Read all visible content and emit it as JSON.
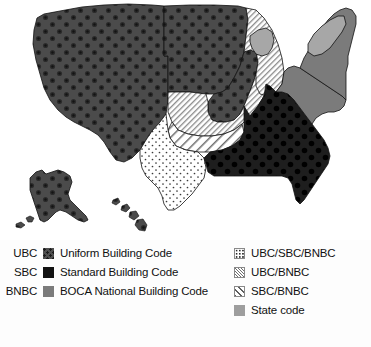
{
  "figure": {
    "kind": "thematic-choropleth-map",
    "region": "United States",
    "title": ""
  },
  "legend": {
    "left_column": [
      {
        "abbr": "UBC",
        "label": "Uniform Building Code",
        "swatch": "dark-gray-textured",
        "color": "#4f4f4f"
      },
      {
        "abbr": "SBC",
        "label": "Standard Building Code",
        "swatch": "black-solid",
        "color": "#121212"
      },
      {
        "abbr": "BNBC",
        "label": "BOCA National Building Code",
        "swatch": "medium-gray-solid",
        "color": "#7b7b7b"
      }
    ],
    "right_column": [
      {
        "abbr": "",
        "label": "UBC/SBC/BNBC",
        "swatch": "white-dotted",
        "color": "#ffffff"
      },
      {
        "abbr": "",
        "label": "UBC/BNBC",
        "swatch": "fine-diagonal-hatch",
        "color": "#ffffff"
      },
      {
        "abbr": "",
        "label": "SBC/BNBC",
        "swatch": "coarse-diagonal-hatch",
        "color": "#ffffff"
      },
      {
        "abbr": "",
        "label": "State code",
        "swatch": "light-gray-solid",
        "color": "#9e9e9e"
      }
    ]
  },
  "map": {
    "categories": {
      "ubc": "Uniform Building Code",
      "sbc": "Standard Building Code",
      "bnbc": "BOCA National Building Code",
      "ubc_sbc_bnbc": "UBC/SBC/BNBC",
      "ubc_bnbc": "UBC/BNBC",
      "sbc_bnbc": "SBC/BNBC",
      "state": "State code"
    },
    "colors": {
      "ubc": "#4f4f4f",
      "sbc": "#121212",
      "bnbc": "#7b7b7b",
      "state": "#9e9e9e",
      "outline": "#111111",
      "background": "#ffffff"
    },
    "areas": [
      {
        "name": "western-states",
        "category": "ubc"
      },
      {
        "name": "plains-states",
        "category": "ubc_bnbc"
      },
      {
        "name": "great-lakes-states",
        "category": "ubc_bnbc"
      },
      {
        "name": "oklahoma-kansas",
        "category": "sbc_bnbc"
      },
      {
        "name": "texas",
        "category": "ubc_sbc_bnbc"
      },
      {
        "name": "southeast-states",
        "category": "sbc"
      },
      {
        "name": "northeast-states",
        "category": "bnbc"
      },
      {
        "name": "mid-atlantic-states",
        "category": "bnbc"
      },
      {
        "name": "wisconsin-michigan",
        "category": "state"
      },
      {
        "name": "new-york-newengland",
        "category": "state"
      },
      {
        "name": "alaska",
        "category": "ubc"
      },
      {
        "name": "hawaii",
        "category": "ubc"
      }
    ]
  }
}
